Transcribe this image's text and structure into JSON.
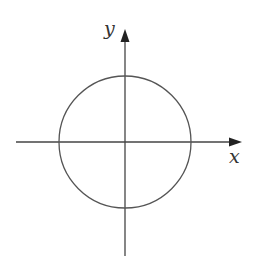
{
  "diagram": {
    "type": "circle-on-cartesian-axes",
    "colors": {
      "stroke": "#555555",
      "axis": "#444444",
      "arrow": "#222222",
      "label": "#333333",
      "background": "#ffffff"
    },
    "axes": {
      "x": {
        "label": "x",
        "from": [
          16,
          142
        ],
        "to": [
          242,
          142
        ]
      },
      "y": {
        "label": "y",
        "from": [
          125,
          256
        ],
        "to": [
          125,
          29
        ]
      }
    },
    "origin": [
      125,
      142
    ],
    "circle": {
      "cx": 125,
      "cy": 142,
      "r": 66
    }
  }
}
